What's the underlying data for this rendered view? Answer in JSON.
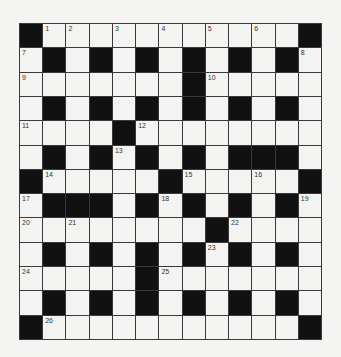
{
  "puzzle": {
    "rows": 13,
    "cols": 13,
    "grid": [
      "#...........#",
      ".#.#.#.#.#.#.",
      ".......#.....",
      ".#.#.#.#.#.#.",
      "....#........",
      ".#.#.#.#.###.",
      "#.....#.....#",
      ".###.#.#.#.#.",
      "........#....",
      ".#.#.#.#.#.#.",
      ".....#.......",
      ".#.#.#.#.#.#.",
      "#...........#"
    ],
    "numbers": [
      {
        "row": 0,
        "col": 1,
        "n": "1"
      },
      {
        "row": 0,
        "col": 2,
        "n": "2"
      },
      {
        "row": 0,
        "col": 4,
        "n": "3"
      },
      {
        "row": 0,
        "col": 6,
        "n": "4"
      },
      {
        "row": 0,
        "col": 8,
        "n": "5"
      },
      {
        "row": 0,
        "col": 10,
        "n": "6"
      },
      {
        "row": 1,
        "col": 0,
        "n": "7"
      },
      {
        "row": 1,
        "col": 12,
        "n": "8"
      },
      {
        "row": 2,
        "col": 0,
        "n": "9"
      },
      {
        "row": 2,
        "col": 8,
        "n": "10"
      },
      {
        "row": 4,
        "col": 0,
        "n": "11"
      },
      {
        "row": 4,
        "col": 5,
        "n": "12"
      },
      {
        "row": 5,
        "col": 4,
        "n": "13"
      },
      {
        "row": 6,
        "col": 1,
        "n": "14"
      },
      {
        "row": 6,
        "col": 7,
        "n": "15"
      },
      {
        "row": 6,
        "col": 10,
        "n": "16"
      },
      {
        "row": 7,
        "col": 0,
        "n": "17"
      },
      {
        "row": 7,
        "col": 6,
        "n": "18"
      },
      {
        "row": 7,
        "col": 12,
        "n": "19"
      },
      {
        "row": 8,
        "col": 0,
        "n": "20"
      },
      {
        "row": 8,
        "col": 2,
        "n": "21"
      },
      {
        "row": 8,
        "col": 9,
        "n": "22"
      },
      {
        "row": 9,
        "col": 8,
        "n": "23"
      },
      {
        "row": 10,
        "col": 0,
        "n": "24"
      },
      {
        "row": 10,
        "col": 6,
        "n": "25"
      },
      {
        "row": 12,
        "col": 1,
        "n": "26"
      }
    ],
    "colors": {
      "block": "#111111",
      "cell": "#f3f3f1",
      "gridline": "#3a3a3a",
      "number": "#333333"
    }
  }
}
